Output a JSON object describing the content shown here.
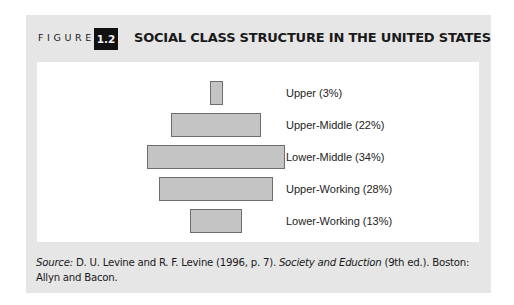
{
  "figure": {
    "label": "FIGURE",
    "number": "1.2",
    "title": "SOCIAL CLASS STRUCTURE IN THE UNITED STATES"
  },
  "chart_data": {
    "type": "bar",
    "orientation": "horizontal-centered",
    "title": "SOCIAL CLASS STRUCTURE IN THE UNITED STATES",
    "categories": [
      "Upper",
      "Upper-Middle",
      "Lower-Middle",
      "Upper-Working",
      "Lower-Working"
    ],
    "values": [
      3,
      22,
      34,
      28,
      13
    ],
    "labels": [
      "Upper (3%)",
      "Upper-Middle (22%)",
      "Lower-Middle (34%)",
      "Upper-Working (28%)",
      "Lower-Working (13%)"
    ],
    "unit": "%",
    "xlabel": "",
    "ylabel": "",
    "grid": false,
    "legend": "none",
    "bar_color": "#c4c4c4",
    "bar_border_color": "#6e6e6e"
  },
  "source": {
    "prefix": "Source:",
    "authors": " D. U. Levine and R. F. Levine (1996, p. 7). ",
    "book_title": "Society and Eduction",
    "rest": " (9th ed.). Boston: Allyn and Bacon."
  }
}
